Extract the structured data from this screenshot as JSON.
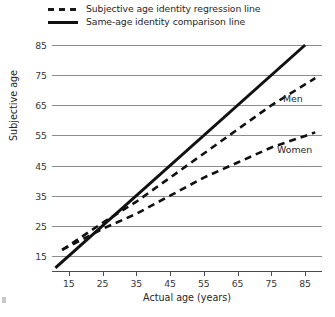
{
  "chart_data": {
    "type": "line",
    "title": "",
    "subtitle": "",
    "xlabel": "Actual age (years)",
    "ylabel": "Subjective age",
    "xlim": [
      10,
      90
    ],
    "ylim": [
      10,
      85
    ],
    "xticks": [
      15,
      25,
      35,
      45,
      55,
      65,
      75,
      85
    ],
    "yticks": [
      15,
      25,
      35,
      45,
      55,
      65,
      75,
      85
    ],
    "xtick_labels": [
      "15",
      "25",
      "35",
      "45",
      "55",
      "65",
      "75",
      "85"
    ],
    "ytick_labels": [
      "15",
      "25",
      "35",
      "45",
      "55",
      "65",
      "75",
      "85"
    ],
    "grid": "horizontal",
    "legend_position": "above-plot-left",
    "legend": [
      {
        "label": "Subjective age identity regression line",
        "style": "dashed",
        "swatch": "dashed-line-swatch"
      },
      {
        "label": "Same-age identity comparison line",
        "style": "solid",
        "swatch": "solid-line-swatch"
      }
    ],
    "series": [
      {
        "name": "Men",
        "style": "dashed",
        "annotation": "Men",
        "x": [
          13,
          25,
          35,
          45,
          55,
          65,
          75,
          88
        ],
        "values": [
          17,
          26,
          33,
          41,
          49,
          57,
          65,
          74
        ]
      },
      {
        "name": "Women",
        "style": "dashed",
        "annotation": "Women",
        "x": [
          13,
          25,
          35,
          45,
          55,
          65,
          75,
          88
        ],
        "values": [
          17,
          24,
          29,
          35,
          41,
          46,
          51,
          56
        ]
      },
      {
        "name": "Same-age identity comparison line",
        "style": "solid",
        "annotation": "",
        "x": [
          11,
          85
        ],
        "values": [
          11,
          85
        ]
      }
    ],
    "annotations": [
      {
        "text": "Men",
        "x": 80,
        "y": 68
      },
      {
        "text": "Women",
        "x": 78,
        "y": 50
      }
    ],
    "colors": {
      "series_line": "#111111",
      "gridline": "#8d8d8d",
      "axis": "#4a4a4a",
      "text": "#272727",
      "background": "#ffffff"
    }
  }
}
